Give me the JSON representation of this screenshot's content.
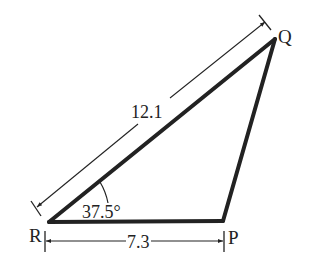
{
  "diagram": {
    "type": "triangle",
    "vertices": {
      "Q": {
        "label": "Q"
      },
      "R": {
        "label": "R"
      },
      "P": {
        "label": "P"
      }
    },
    "measurements": {
      "side_RQ": "12.1",
      "side_RP": "7.3",
      "angle_R": "37.5°"
    },
    "colors": {
      "stroke": "#222222",
      "background": "#ffffff"
    }
  }
}
